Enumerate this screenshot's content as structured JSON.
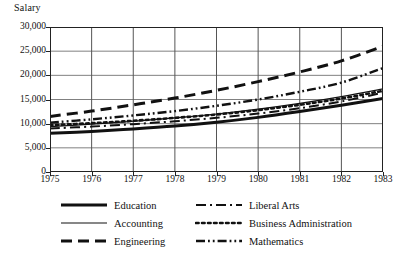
{
  "chart_data": {
    "type": "line",
    "title": "",
    "ylabel": "Salary",
    "xlabel": "",
    "x": [
      1975,
      1976,
      1977,
      1978,
      1979,
      1980,
      1981,
      1982,
      1983
    ],
    "xtick_labels": [
      "1975",
      "1976",
      "1977",
      "1978",
      "1979",
      "1980",
      "1981",
      "1982",
      "1983"
    ],
    "ytick_labels": [
      "0",
      "5,000",
      "10,000",
      "15,000",
      "20,000",
      "25,000",
      "30,000"
    ],
    "ytick_values": [
      0,
      5000,
      10000,
      15000,
      20000,
      25000,
      30000
    ],
    "xlim": [
      1975,
      1983
    ],
    "ylim": [
      0,
      30000
    ],
    "grid": true,
    "legend_position": "below",
    "series": [
      {
        "name": "Education",
        "style": "solid-thick",
        "values": [
          8000,
          8400,
          8900,
          9500,
          10300,
          11300,
          12500,
          13800,
          15200
        ]
      },
      {
        "name": "Accounting",
        "style": "solid-thin",
        "values": [
          9400,
          9900,
          10500,
          11200,
          12000,
          13000,
          14200,
          15600,
          17200
        ]
      },
      {
        "name": "Engineering",
        "style": "dashed",
        "values": [
          11500,
          12600,
          13900,
          15300,
          16900,
          18700,
          20700,
          23000,
          26000
        ]
      },
      {
        "name": "Liberal Arts",
        "style": "dash-dot",
        "values": [
          9000,
          9400,
          9900,
          10500,
          11200,
          12100,
          13200,
          14600,
          16400
        ]
      },
      {
        "name": "Business Administration",
        "style": "dotted",
        "values": [
          9700,
          10100,
          10600,
          11200,
          11900,
          12800,
          13900,
          15200,
          16800
        ]
      },
      {
        "name": "Mathematics",
        "style": "dash-dot-dot",
        "values": [
          10200,
          10900,
          11700,
          12600,
          13700,
          15000,
          16600,
          18500,
          21500
        ]
      }
    ]
  },
  "legend": {
    "left": [
      {
        "label": "Education",
        "style": "solid-thick"
      },
      {
        "label": "Accounting",
        "style": "solid-thin"
      },
      {
        "label": "Engineering",
        "style": "dashed"
      }
    ],
    "right": [
      {
        "label": "Liberal Arts",
        "style": "dash-dot"
      },
      {
        "label": "Business Administration",
        "style": "dotted"
      },
      {
        "label": "Mathematics",
        "style": "dash-dot-dot"
      }
    ]
  },
  "colors": {
    "ink": "#111111",
    "grid": "#808080",
    "frame": "#222222",
    "background": "#ffffff"
  }
}
